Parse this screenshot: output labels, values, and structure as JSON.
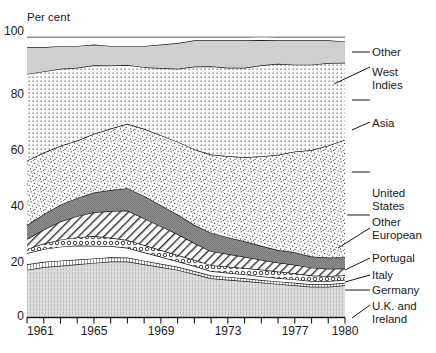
{
  "chart_data": {
    "type": "area",
    "title": "",
    "ylabel": "Per cent",
    "xlabel": "",
    "ylim": [
      0,
      100
    ],
    "xlim": [
      1961,
      1980
    ],
    "grid": true,
    "legend_position": "right-outside",
    "stacked": true,
    "y_ticks": [
      "0",
      "20",
      "40",
      "60",
      "80",
      "100"
    ],
    "y_tick_values": [
      0,
      20,
      40,
      60,
      80,
      100
    ],
    "x_ticks": [
      "1961",
      "1965",
      "1969",
      "1973",
      "1977",
      "1980"
    ],
    "x_tick_values": [
      1961,
      1965,
      1969,
      1973,
      1977,
      1980
    ],
    "x": [
      1961,
      1962,
      1963,
      1964,
      1965,
      1966,
      1967,
      1968,
      1969,
      1970,
      1971,
      1972,
      1973,
      1974,
      1975,
      1976,
      1977,
      1978,
      1979,
      1980
    ],
    "series": [
      {
        "name": "U.K. and Ireland",
        "pattern": "light-grey-vertical-texture",
        "color": "#d8d8d8",
        "values": [
          17.0,
          18.0,
          18.5,
          19.0,
          19.5,
          20.0,
          20.0,
          19.0,
          18.0,
          17.0,
          15.5,
          14.0,
          13.5,
          13.0,
          12.5,
          12.0,
          11.5,
          11.0,
          11.0,
          11.5
        ]
      },
      {
        "name": "Germany",
        "pattern": "fine-vertical-hatch",
        "color": "#f0f0f0",
        "values": [
          2.0,
          1.9,
          1.8,
          1.7,
          1.6,
          1.5,
          1.4,
          1.3,
          1.2,
          1.1,
          1.1,
          1.0,
          1.0,
          1.0,
          0.9,
          0.9,
          0.9,
          0.9,
          0.9,
          0.9
        ]
      },
      {
        "name": "Italy",
        "pattern": "white",
        "color": "#ffffff",
        "values": [
          4.0,
          4.5,
          5.0,
          5.0,
          4.5,
          4.0,
          3.5,
          3.0,
          2.5,
          2.0,
          1.8,
          1.6,
          1.5,
          1.4,
          1.3,
          1.2,
          1.2,
          1.1,
          1.1,
          1.1
        ]
      },
      {
        "name": "Portugal",
        "pattern": "coarse-chain",
        "color": "#ffffff",
        "values": [
          1.5,
          2.0,
          2.5,
          3.0,
          3.5,
          3.0,
          2.8,
          2.6,
          2.4,
          2.2,
          2.2,
          2.1,
          2.2,
          2.3,
          2.4,
          2.3,
          2.2,
          2.0,
          1.8,
          1.6
        ]
      },
      {
        "name": "Other European",
        "pattern": "diagonal-hatch",
        "color": "#e8e8e8",
        "values": [
          3.5,
          5.0,
          6.5,
          7.5,
          8.5,
          9.5,
          10.5,
          9.5,
          8.5,
          7.5,
          6.0,
          5.0,
          4.5,
          4.0,
          3.5,
          3.2,
          3.0,
          2.8,
          2.6,
          2.4
        ]
      },
      {
        "name": "United States",
        "pattern": "dark-grey-solid",
        "color": "#8a8a8a",
        "values": [
          5.0,
          5.5,
          6.0,
          6.5,
          7.0,
          7.5,
          8.0,
          8.0,
          7.5,
          7.0,
          6.5,
          6.5,
          6.0,
          5.5,
          5.0,
          4.5,
          4.5,
          4.0,
          4.0,
          4.0
        ]
      },
      {
        "name": "Asia",
        "pattern": "fine-stipple",
        "color": "#fafafa",
        "values": [
          23.0,
          22.0,
          21.0,
          20.5,
          21.0,
          22.0,
          23.0,
          24.0,
          25.0,
          26.0,
          27.0,
          28.0,
          29.0,
          30.0,
          32.0,
          34.0,
          36.0,
          38.0,
          40.0,
          42.0
        ]
      },
      {
        "name": "West Indies",
        "pattern": "dot-grid",
        "color": "#f5f5f5",
        "values": [
          31.0,
          29.0,
          27.5,
          26.0,
          24.5,
          22.5,
          21.0,
          22.0,
          24.0,
          26.0,
          29.5,
          31.5,
          31.5,
          32.0,
          32.5,
          32.5,
          31.0,
          30.5,
          29.5,
          27.5
        ]
      },
      {
        "name": "Other",
        "pattern": "light-grey-solid",
        "color": "#cccccc",
        "values": [
          9.5,
          8.6,
          8.2,
          7.8,
          7.4,
          7.0,
          6.8,
          7.6,
          8.4,
          9.2,
          9.4,
          9.3,
          9.8,
          9.8,
          9.0,
          8.4,
          8.7,
          8.7,
          8.1,
          7.6
        ]
      },
      {
        "name": "Top",
        "pattern": "white",
        "color": "#ffffff",
        "values": [
          3.5,
          3.5,
          3.0,
          3.0,
          2.5,
          3.0,
          3.0,
          3.0,
          2.5,
          2.0,
          1.0,
          1.0,
          1.0,
          1.0,
          1.0,
          1.0,
          1.0,
          1.0,
          1.0,
          1.4
        ]
      }
    ]
  },
  "axis": {
    "unit_label": "Per cent",
    "y_top_label": "100",
    "y_80": "80",
    "y_60": "60",
    "y_40": "40",
    "y_20": "20",
    "y_0": "0",
    "x_1961": "1961",
    "x_1965": "1965",
    "x_1969": "1969",
    "x_1973": "1973",
    "x_1977": "1977",
    "x_1980": "1980"
  },
  "series_labels": {
    "other": "Other",
    "west_indies_line1": "West",
    "west_indies_line2": "Indies",
    "asia": "Asia",
    "united_states_line1": "United",
    "united_states_line2": "States",
    "other_european_line1": "Other",
    "other_european_line2": "European",
    "portugal": "Portugal",
    "italy": "Italy",
    "germany": "Germany",
    "uk_ireland_line1": "U.K. and",
    "uk_ireland_line2": "Ireland"
  },
  "colors": {
    "stroke": "#1a1a1a",
    "grid": "#9a9a9a",
    "background": "#ffffff"
  }
}
